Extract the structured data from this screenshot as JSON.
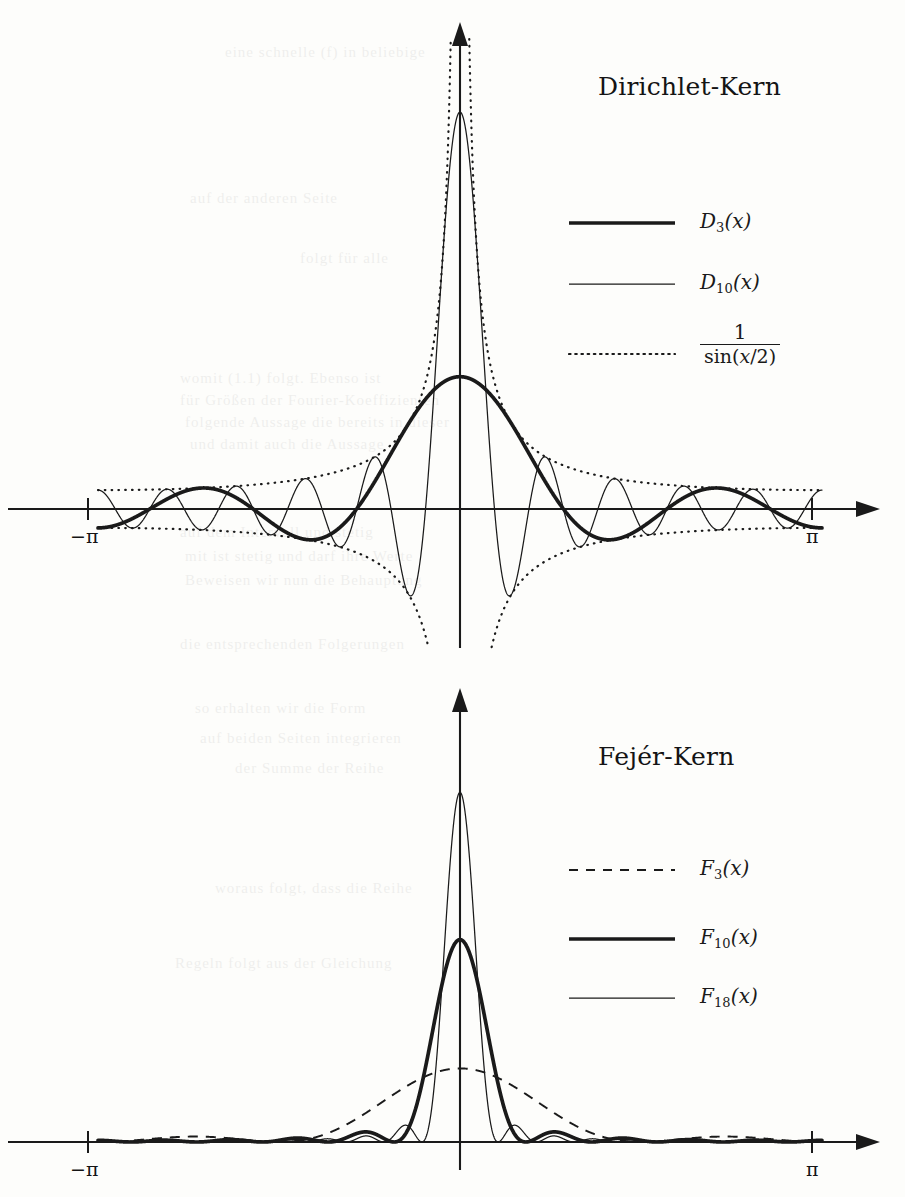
{
  "page": {
    "width": 905,
    "height": 1197,
    "background": "#fdfdfb",
    "ink": "#1a1a1a"
  },
  "figures": [
    {
      "id": "dirichlet",
      "title": "Dirichlet-Kern",
      "axis": {
        "x_left_label": "−π",
        "x_right_label": "π",
        "x_min": -3.141592653589793,
        "x_max": 3.141592653589793
      },
      "legend": [
        {
          "label_main": "D",
          "label_sub": "3",
          "label_tail": "(x)",
          "style": "solid-thick"
        },
        {
          "label_main": "D",
          "label_sub": "10",
          "label_tail": "(x)",
          "style": "solid-thin"
        },
        {
          "label_numerator": "1",
          "label_denominator": "sin(x/2)",
          "style": "dotted"
        }
      ]
    },
    {
      "id": "fejer",
      "title": "Fejér-Kern",
      "axis": {
        "x_left_label": "−π",
        "x_right_label": "π",
        "x_min": -3.141592653589793,
        "x_max": 3.141592653589793
      },
      "legend": [
        {
          "label_main": "F",
          "label_sub": "3",
          "label_tail": "(x)",
          "style": "dashed"
        },
        {
          "label_main": "F",
          "label_sub": "10",
          "label_tail": "(x)",
          "style": "solid-thick"
        },
        {
          "label_main": "F",
          "label_sub": "18",
          "label_tail": "(x)",
          "style": "solid-thin"
        }
      ]
    }
  ],
  "chart_data": [
    {
      "type": "line",
      "id": "dirichlet-kernel",
      "title": "Dirichlet-Kern",
      "xlabel": "",
      "ylabel": "",
      "xlim": [
        -3.141592653589793,
        3.141592653589793
      ],
      "xticks": [
        -3.141592653589793,
        3.141592653589793
      ],
      "xticklabels": [
        "−π",
        "π"
      ],
      "grid": false,
      "legend_position": "upper-right",
      "series": [
        {
          "name": "D_3(x)",
          "formula": "sin((3+0.5)x)/sin(x/2)",
          "n": 3,
          "peak_value": 7,
          "linestyle": "solid",
          "linewidth": 3.4,
          "color": "#1a1a1a"
        },
        {
          "name": "D_10(x)",
          "formula": "sin((10+0.5)x)/sin(x/2)",
          "n": 10,
          "peak_value": 21,
          "linestyle": "solid",
          "linewidth": 1.1,
          "color": "#1a1a1a"
        },
        {
          "name": "1/sin(x/2)",
          "formula": "±1/sin(x/2)",
          "envelope": true,
          "linestyle": "dotted",
          "linewidth": 1.6,
          "color": "#1a1a1a"
        }
      ]
    },
    {
      "type": "line",
      "id": "fejer-kernel",
      "title": "Fejér-Kern",
      "xlabel": "",
      "ylabel": "",
      "xlim": [
        -3.141592653589793,
        3.141592653589793
      ],
      "xticks": [
        -3.141592653589793,
        3.141592653589793
      ],
      "xticklabels": [
        "−π",
        "π"
      ],
      "grid": false,
      "legend_position": "upper-right",
      "series": [
        {
          "name": "F_3(x)",
          "formula": "(1/(n+1))*(sin((n+1)x/2)/sin(x/2))^2",
          "n": 3,
          "peak_value": 4,
          "linestyle": "dashed",
          "linewidth": 1.9,
          "color": "#1a1a1a"
        },
        {
          "name": "F_10(x)",
          "formula": "(1/(n+1))*(sin((n+1)x/2)/sin(x/2))^2",
          "n": 10,
          "peak_value": 11,
          "linestyle": "solid",
          "linewidth": 3.4,
          "color": "#1a1a1a"
        },
        {
          "name": "F_18(x)",
          "formula": "(1/(n+1))*(sin((n+1)x/2)/sin(x/2))^2",
          "n": 18,
          "peak_value": 19,
          "linestyle": "solid",
          "linewidth": 1.1,
          "color": "#1a1a1a"
        }
      ]
    }
  ],
  "bleed_text": [
    {
      "text": "eine schnelle   (f)   in beliebige",
      "x": 225,
      "y": 44
    },
    {
      "text": "auf  der  anderen  Seite",
      "x": 190,
      "y": 190
    },
    {
      "text": "folgt  für   alle",
      "x": 300,
      "y": 250
    },
    {
      "text": "womit   (1.1)   folgt.  Ebenso   ist",
      "x": 180,
      "y": 370
    },
    {
      "text": "für   Größen   der   Fourier-Koeffizienten",
      "x": 180,
      "y": 392
    },
    {
      "text": "folgende  Aussage  die   bereits   in  dieser",
      "x": 185,
      "y": 414
    },
    {
      "text": "und   damit   auch   die   Aussage",
      "x": 190,
      "y": 436
    },
    {
      "text": "auf  dem  Intervall  und  stetig",
      "x": 180,
      "y": 524
    },
    {
      "text": "mit   ist   stetig   und   darf   ihre   Werte",
      "x": 185,
      "y": 548
    },
    {
      "text": "Beweisen  wir  nun  die  Behauptung",
      "x": 185,
      "y": 572
    },
    {
      "text": "die   entsprechenden   Folgerungen",
      "x": 180,
      "y": 636
    },
    {
      "text": "so   erhalten   wir   die   Form",
      "x": 195,
      "y": 700
    },
    {
      "text": "auf  beiden  Seiten  integrieren",
      "x": 200,
      "y": 730
    },
    {
      "text": "der   Summe   der   Reihe",
      "x": 235,
      "y": 760
    },
    {
      "text": "woraus  folgt,  dass  die  Reihe",
      "x": 215,
      "y": 880
    },
    {
      "text": "Regeln  folgt  aus  der  Gleichung",
      "x": 175,
      "y": 955
    }
  ]
}
